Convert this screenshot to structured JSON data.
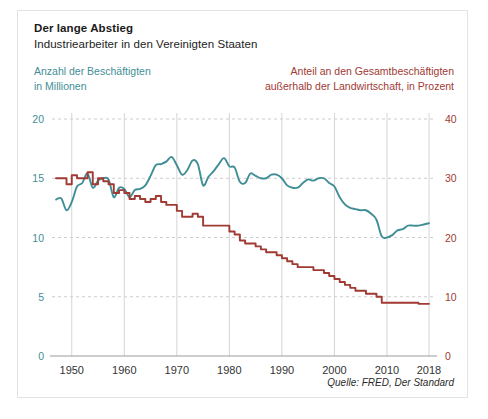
{
  "figure": {
    "title": "Der lange Abstieg",
    "subtitle": "Industriearbeiter in den Vereinigten Staaten",
    "legend_left_line1": "Anzahl der Beschäftigten",
    "legend_left_line2": "in Millionen",
    "legend_right_line1": "Anteil an den Gesamtbeschäftigten",
    "legend_right_line2": "außerhalb der Landwirtschaft, in Prozent",
    "source": "Quelle: FRED, Der Standard",
    "colors": {
      "teal": "#3f8e96",
      "red": "#a03a33",
      "grid": "#cccccc",
      "axis": "#9a9a9a",
      "frame": "#e3e3e3",
      "title": "#1a1a1a"
    }
  },
  "chart_data": {
    "type": "line",
    "title": "Der lange Abstieg",
    "subtitle": "Industriearbeiter in den Vereinigten Staaten",
    "xlabel": "",
    "xlim": [
      1947,
      2018
    ],
    "grid": true,
    "legend_position": "top",
    "x_ticks": [
      1950,
      1960,
      1970,
      1980,
      1990,
      2000,
      2010,
      2018
    ],
    "x_tick_labels": [
      "1950",
      "1960",
      "1970",
      "1980",
      "1990",
      "2000",
      "2010",
      "2018"
    ],
    "axes": [
      {
        "id": "left",
        "side": "left",
        "label": "Anzahl der Beschäftigten in Millionen",
        "color": "#3f8e96",
        "ylim": [
          0,
          20
        ],
        "ticks": [
          0,
          5,
          10,
          15,
          20
        ],
        "tick_labels": [
          "0",
          "5",
          "10",
          "15",
          "20"
        ]
      },
      {
        "id": "right",
        "side": "right",
        "label": "Anteil an den Gesamtbeschäftigten außerhalb der Landwirtschaft, in Prozent",
        "color": "#a03a33",
        "ylim": [
          0,
          40
        ],
        "ticks": [
          0,
          10,
          20,
          30,
          40
        ],
        "tick_labels": [
          "0",
          "10",
          "20",
          "30",
          "40"
        ]
      }
    ],
    "series": [
      {
        "name": "Anzahl der Beschäftigten in Millionen",
        "axis": "left",
        "color": "#3f8e96",
        "units": "Millionen",
        "x": [
          1947,
          1948,
          1949,
          1950,
          1951,
          1952,
          1953,
          1954,
          1955,
          1956,
          1957,
          1958,
          1959,
          1960,
          1961,
          1962,
          1963,
          1964,
          1965,
          1966,
          1967,
          1968,
          1969,
          1970,
          1971,
          1972,
          1973,
          1974,
          1975,
          1976,
          1977,
          1978,
          1979,
          1980,
          1981,
          1982,
          1983,
          1984,
          1985,
          1986,
          1987,
          1988,
          1989,
          1990,
          1991,
          1992,
          1993,
          1994,
          1995,
          1996,
          1997,
          1998,
          1999,
          2000,
          2001,
          2002,
          2003,
          2004,
          2005,
          2006,
          2007,
          2008,
          2009,
          2010,
          2011,
          2012,
          2013,
          2014,
          2015,
          2016,
          2017,
          2018
        ],
        "values": [
          13.2,
          13.3,
          12.3,
          13.0,
          14.3,
          14.6,
          15.4,
          14.2,
          14.8,
          15.0,
          14.9,
          13.4,
          14.2,
          14.1,
          13.4,
          14.0,
          14.1,
          14.4,
          15.2,
          16.1,
          16.2,
          16.4,
          16.8,
          16.1,
          15.3,
          15.7,
          16.5,
          16.2,
          14.4,
          15.1,
          15.6,
          16.2,
          16.7,
          16.0,
          15.9,
          14.7,
          14.6,
          15.4,
          15.2,
          15.0,
          15.0,
          15.3,
          15.3,
          15.0,
          14.4,
          14.2,
          14.2,
          14.6,
          14.9,
          14.8,
          15.0,
          15.0,
          14.6,
          14.3,
          13.4,
          12.8,
          12.5,
          12.4,
          12.3,
          12.3,
          12.0,
          11.5,
          10.1,
          10.0,
          10.2,
          10.6,
          10.7,
          11.0,
          11.0,
          11.0,
          11.1,
          11.2
        ],
        "endpoints": {
          "first": 13.2,
          "last": 11.2,
          "peak": 16.8,
          "peak_year": 1979
        }
      },
      {
        "name": "Anteil an den Gesamtbeschäftigten außerhalb der Landwirtschaft, in Prozent",
        "axis": "right",
        "color": "#a03a33",
        "units": "Prozent",
        "style": "step",
        "x": [
          1947,
          1948,
          1949,
          1950,
          1951,
          1952,
          1953,
          1954,
          1955,
          1956,
          1957,
          1958,
          1959,
          1960,
          1961,
          1962,
          1963,
          1964,
          1965,
          1966,
          1967,
          1968,
          1969,
          1970,
          1971,
          1972,
          1973,
          1974,
          1975,
          1976,
          1977,
          1978,
          1979,
          1980,
          1981,
          1982,
          1983,
          1984,
          1985,
          1986,
          1987,
          1988,
          1989,
          1990,
          1991,
          1992,
          1993,
          1994,
          1995,
          1996,
          1997,
          1998,
          1999,
          2000,
          2001,
          2002,
          2003,
          2004,
          2005,
          2006,
          2007,
          2008,
          2009,
          2010,
          2011,
          2012,
          2013,
          2014,
          2015,
          2016,
          2017,
          2018
        ],
        "values": [
          30.0,
          30.0,
          29.0,
          30.5,
          30.0,
          30.0,
          31.0,
          29.0,
          30.0,
          29.5,
          29.0,
          27.5,
          28.0,
          27.5,
          26.5,
          27.0,
          26.5,
          26.0,
          26.5,
          27.0,
          26.0,
          25.5,
          25.5,
          24.5,
          23.5,
          23.5,
          24.0,
          23.5,
          22.0,
          22.0,
          22.0,
          22.0,
          22.0,
          21.0,
          20.5,
          19.5,
          19.0,
          19.0,
          18.5,
          18.0,
          17.5,
          17.5,
          17.0,
          16.5,
          16.0,
          15.5,
          15.0,
          15.0,
          15.0,
          14.5,
          14.5,
          14.0,
          13.5,
          13.0,
          12.5,
          12.0,
          11.5,
          11.0,
          11.0,
          10.5,
          10.5,
          10.0,
          9.0,
          9.0,
          9.0,
          9.0,
          9.0,
          9.0,
          9.0,
          8.8,
          8.8,
          8.8
        ],
        "endpoints": {
          "first": 30.0,
          "last": 8.8
        }
      }
    ]
  }
}
